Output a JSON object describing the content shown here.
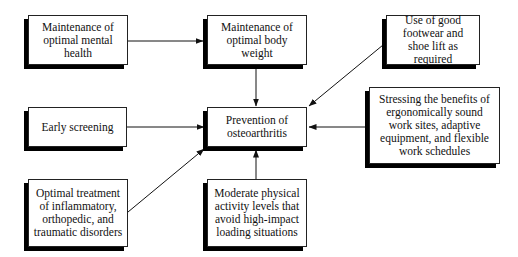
{
  "diagram": {
    "center": {
      "id": "prevention",
      "label": "Prevention of osteoarthritis"
    },
    "factors": [
      {
        "id": "mental_health",
        "label": "Maintenance of optimal mental health"
      },
      {
        "id": "body_weight",
        "label": "Maintenance of optimal body weight"
      },
      {
        "id": "footwear",
        "label": "Use of good footwear and shoe lift as required"
      },
      {
        "id": "early_screening",
        "label": "Early screening"
      },
      {
        "id": "ergonomics",
        "label": "Stressing the benefits of ergonomically sound work sites, adaptive equipment, and flexible work schedules"
      },
      {
        "id": "treatment",
        "label": "Optimal treatment of inflammatory, orthopedic, and traumatic disorders"
      },
      {
        "id": "physical_activity",
        "label": "Moderate physical activity levels that avoid high-impact loading situations"
      }
    ],
    "edges": [
      {
        "from": "mental_health",
        "to": "body_weight"
      },
      {
        "from": "body_weight",
        "to": "prevention"
      },
      {
        "from": "footwear",
        "to": "prevention"
      },
      {
        "from": "early_screening",
        "to": "prevention"
      },
      {
        "from": "ergonomics",
        "to": "prevention"
      },
      {
        "from": "treatment",
        "to": "prevention"
      },
      {
        "from": "physical_activity",
        "to": "prevention"
      }
    ]
  }
}
